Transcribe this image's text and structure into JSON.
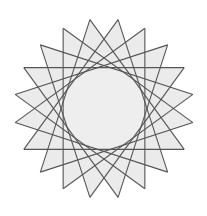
{
  "figure": {
    "type": "star-polygon",
    "points": 20,
    "step": 7,
    "center": [
      104,
      108.5
    ],
    "outer_radius": 90,
    "rotation_offset_deg": 9,
    "colors": {
      "background": "#ffffff",
      "fill": "#ebebeb",
      "inner_fill": "#eeeeee",
      "stroke": "#555555"
    },
    "stroke_width": 1.1
  }
}
